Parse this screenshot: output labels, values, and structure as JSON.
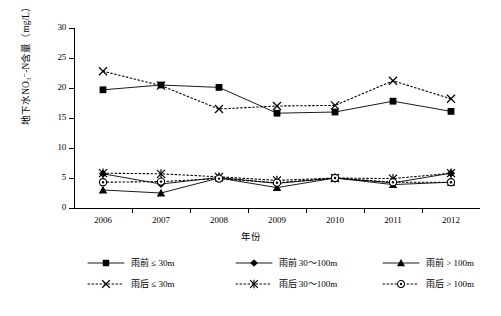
{
  "chart_data": {
    "type": "line",
    "title": "",
    "xlabel": "年份",
    "ylabel": "地下水NO₃⁻-N含量（mg/L）",
    "categories": [
      "2006",
      "2007",
      "2008",
      "2009",
      "2010",
      "2011",
      "2012"
    ],
    "ylim": [
      0,
      30
    ],
    "yticks": [
      0,
      5,
      10,
      15,
      20,
      25,
      30
    ],
    "grid": false,
    "legend_position": "bottom",
    "series": [
      {
        "name": "雨前 ≤ 30m",
        "marker": "square",
        "line": "solid",
        "values": [
          19.7,
          20.5,
          20.1,
          15.8,
          16.0,
          17.8,
          16.1
        ]
      },
      {
        "name": "雨前 30～100m",
        "marker": "diamond",
        "line": "solid",
        "values": [
          5.7,
          4.0,
          5.1,
          4.1,
          5.0,
          4.2,
          5.8
        ]
      },
      {
        "name": "雨前 > 100m",
        "marker": "triangle",
        "line": "solid",
        "values": [
          3.0,
          2.5,
          5.0,
          3.4,
          5.0,
          3.9,
          4.3
        ]
      },
      {
        "name": "雨后 ≤ 30m",
        "marker": "cross",
        "line": "dotted",
        "values": [
          22.8,
          20.4,
          16.5,
          17.0,
          17.1,
          21.2,
          18.2
        ]
      },
      {
        "name": "雨后 30～100m",
        "marker": "asterisk",
        "line": "dotted",
        "values": [
          5.8,
          5.7,
          5.2,
          4.6,
          5.0,
          4.9,
          5.8
        ]
      },
      {
        "name": "雨后 > 100m",
        "marker": "circle-dot",
        "line": "dotted",
        "values": [
          4.3,
          4.4,
          4.9,
          4.2,
          5.0,
          4.3,
          4.3
        ]
      }
    ]
  },
  "axes": {
    "y_title": "地下水NO₃⁻-N含量（mg/L）",
    "x_title": "年份",
    "y_tick_labels": [
      "30",
      "25",
      "20",
      "15",
      "10",
      "5",
      "0"
    ],
    "x_tick_labels": [
      "2006",
      "2007",
      "2008",
      "2009",
      "2010",
      "2011",
      "2012"
    ]
  },
  "legend": {
    "rows": [
      [
        {
          "label": "雨前 ≤ 30m",
          "marker": "square",
          "line": "solid"
        },
        {
          "label": "雨前 30～100m",
          "marker": "diamond",
          "line": "solid"
        },
        {
          "label": "雨前 > 100m",
          "marker": "triangle",
          "line": "solid"
        }
      ],
      [
        {
          "label": "雨后 ≤ 30m",
          "marker": "cross",
          "line": "dotted"
        },
        {
          "label": "雨后 30～100m",
          "marker": "asterisk",
          "line": "dotted"
        },
        {
          "label": "雨后 > 100m",
          "marker": "circle-dot",
          "line": "dotted"
        }
      ]
    ]
  },
  "colors": {
    "ink": "#000000",
    "background": "#ffffff"
  }
}
